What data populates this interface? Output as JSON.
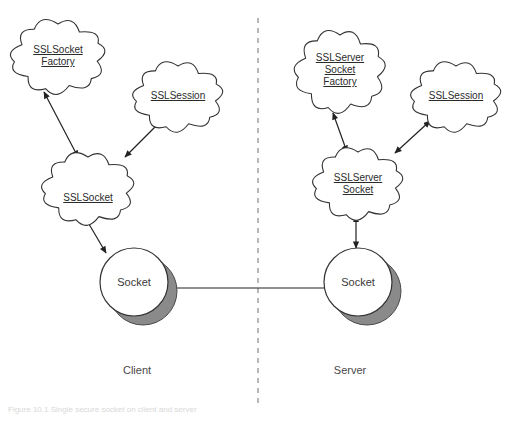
{
  "figure": {
    "caption": "Figure 10.1 Single secure socket on client and server",
    "background_color": "#ffffff",
    "stroke_color": "#333333",
    "text_color": "#2b2b2b",
    "shadow_color": "#8a8a8a",
    "divider_color": "#9a9a9a"
  },
  "divider": {
    "name": "client-server-divider",
    "style": "dashed-vertical",
    "x": 258,
    "y_top": 18,
    "y_bottom": 408
  },
  "sides": [
    {
      "id": "client",
      "label": "Client",
      "x": 137,
      "y": 364
    },
    {
      "id": "server",
      "label": "Server",
      "x": 350,
      "y": 364
    }
  ],
  "clouds": [
    {
      "id": "sslsocketfactory",
      "lines": [
        "SSLSocket",
        "Factory"
      ],
      "cx": 58,
      "cy": 57,
      "rx": 44,
      "ry": 33,
      "label_x": 58,
      "label_y": 44
    },
    {
      "id": "sslsession-client",
      "lines": [
        "SSLSession"
      ],
      "cx": 178,
      "cy": 97,
      "rx": 42,
      "ry": 31,
      "label_x": 178,
      "label_y": 90
    },
    {
      "id": "sslsocket",
      "lines": [
        "SSLSocket"
      ],
      "cx": 88,
      "cy": 189,
      "rx": 43,
      "ry": 32,
      "label_x": 88,
      "label_y": 192
    },
    {
      "id": "sslserversocketfactory",
      "lines": [
        "SSLServer",
        "Socket",
        "Factory"
      ],
      "cx": 340,
      "cy": 72,
      "rx": 42,
      "ry": 37,
      "label_x": 340,
      "label_y": 52
    },
    {
      "id": "sslsession-server",
      "lines": [
        "SSLSession"
      ],
      "cx": 456,
      "cy": 97,
      "rx": 42,
      "ry": 31,
      "label_x": 456,
      "label_y": 90
    },
    {
      "id": "sslserversocket",
      "lines": [
        "SSLServer",
        "Socket"
      ],
      "cx": 358,
      "cy": 184,
      "rx": 42,
      "ry": 32,
      "label_x": 358,
      "label_y": 172
    }
  ],
  "circles": [
    {
      "id": "socket-client",
      "label": "Socket",
      "cx": 134,
      "cy": 282,
      "r": 34,
      "label_x": 134,
      "label_y": 276
    },
    {
      "id": "socket-server",
      "label": "Socket",
      "cx": 358,
      "cy": 282,
      "r": 34,
      "label_x": 358,
      "label_y": 276
    }
  ],
  "connections": [
    {
      "id": "sslsocketfactory-to-sslsocket",
      "from": "sslsocketfactory",
      "to": "sslsocket",
      "heads": "both",
      "x1": 44,
      "y1": 92,
      "x2": 78,
      "y2": 157
    },
    {
      "id": "sslsocket-to-sslsession",
      "from": "sslsocket",
      "to": "sslsession-client",
      "heads": "both",
      "x1": 125,
      "y1": 157,
      "x2": 161,
      "y2": 121
    },
    {
      "id": "sslsocket-to-socket-client",
      "from": "sslsocket",
      "to": "socket-client",
      "heads": "both",
      "x1": 106,
      "y1": 253,
      "x2": 86,
      "y2": 219
    },
    {
      "id": "sslserversocketfactory-to-sslserversocket",
      "from": "sslserversocketfactory",
      "to": "sslserversocket",
      "heads": "both",
      "x1": 333,
      "y1": 113,
      "x2": 347,
      "y2": 152
    },
    {
      "id": "sslserversocket-to-sslsession",
      "from": "sslserversocket",
      "to": "sslsession-server",
      "heads": "both",
      "x1": 395,
      "y1": 153,
      "x2": 430,
      "y2": 121
    },
    {
      "id": "sslserversocket-to-socket-server",
      "from": "sslserversocket",
      "to": "socket-server",
      "heads": "both",
      "x1": 356,
      "y1": 248,
      "x2": 356,
      "y2": 216
    },
    {
      "id": "socket-client-to-socket-server",
      "from": "socket-client",
      "to": "socket-server",
      "heads": "both",
      "x1": 167,
      "y1": 288,
      "x2": 345,
      "y2": 288
    }
  ]
}
